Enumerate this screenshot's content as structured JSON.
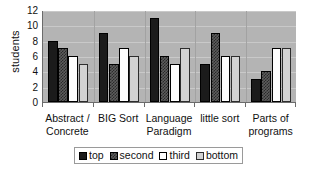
{
  "chart_data": {
    "type": "bar",
    "title": "",
    "xlabel": "",
    "ylabel": "students",
    "ylim": [
      0,
      12
    ],
    "yticks": [
      12,
      10,
      8,
      6,
      4,
      2,
      0
    ],
    "grid": true,
    "legend_position": "bottom",
    "categories": [
      "Abstract / Concrete",
      "BIG Sort",
      "Language Paradigm",
      "little sort",
      "Parts of programs"
    ],
    "category_lines": [
      {
        "line1": "Abstract /",
        "line2": "Concrete"
      },
      {
        "line1": "BIG Sort",
        "line2": ""
      },
      {
        "line1": "Language",
        "line2": "Paradigm"
      },
      {
        "line1": "little sort",
        "line2": ""
      },
      {
        "line1": "Parts of",
        "line2": "programs"
      }
    ],
    "series": [
      {
        "name": "top",
        "values": [
          8,
          9,
          11,
          5,
          3
        ]
      },
      {
        "name": "second",
        "values": [
          7,
          5,
          6,
          9,
          4
        ]
      },
      {
        "name": "third",
        "values": [
          6,
          7,
          5,
          6,
          7
        ]
      },
      {
        "name": "bottom",
        "values": [
          5,
          6,
          7,
          6,
          7
        ]
      }
    ]
  },
  "legend": {
    "items": [
      {
        "label": "top",
        "swatch": "solid-black"
      },
      {
        "label": "second",
        "swatch": "checkered-dark"
      },
      {
        "label": "third",
        "swatch": "white"
      },
      {
        "label": "bottom",
        "swatch": "light-gray"
      }
    ]
  },
  "colors": {
    "plot_background": "#b4b4b4",
    "gridline": "#c9c9c9",
    "axis": "#6b6b6b",
    "series_top": "#1b1b1b",
    "series_second": "#5d5d5d",
    "series_third": "#fdfdfd",
    "series_bottom": "#d2d2d2",
    "text": "#111111"
  }
}
